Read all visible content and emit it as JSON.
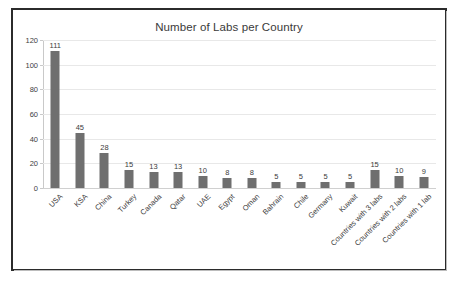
{
  "chart_data": {
    "type": "bar",
    "title": "Number of Labs per Country",
    "xlabel": "",
    "ylabel": "",
    "ylim": [
      0,
      120
    ],
    "yticks": [
      0,
      20,
      40,
      60,
      80,
      100,
      120
    ],
    "grid": true,
    "legend": false,
    "bar_color": "#6f6f6f",
    "categories": [
      "USA",
      "KSA",
      "China",
      "Turkey",
      "Canada",
      "Qatar",
      "UAE",
      "Egypt",
      "Oman",
      "Bahrain",
      "Chile",
      "Germany",
      "Kuwait",
      "Countries with 3 labs",
      "Countries with 2 labs",
      "Countries with 1 lab"
    ],
    "values": [
      111,
      45,
      28,
      15,
      13,
      13,
      10,
      8,
      8,
      5,
      5,
      5,
      5,
      15,
      10,
      9
    ],
    "data_labels": [
      "111",
      "45",
      "28",
      "15",
      "13",
      "13",
      "10",
      "8",
      "8",
      "5",
      "5",
      "5",
      "5",
      "15",
      "10",
      "9"
    ],
    "ytick_labels": [
      "0",
      "20",
      "40",
      "60",
      "80",
      "100",
      "120"
    ]
  }
}
